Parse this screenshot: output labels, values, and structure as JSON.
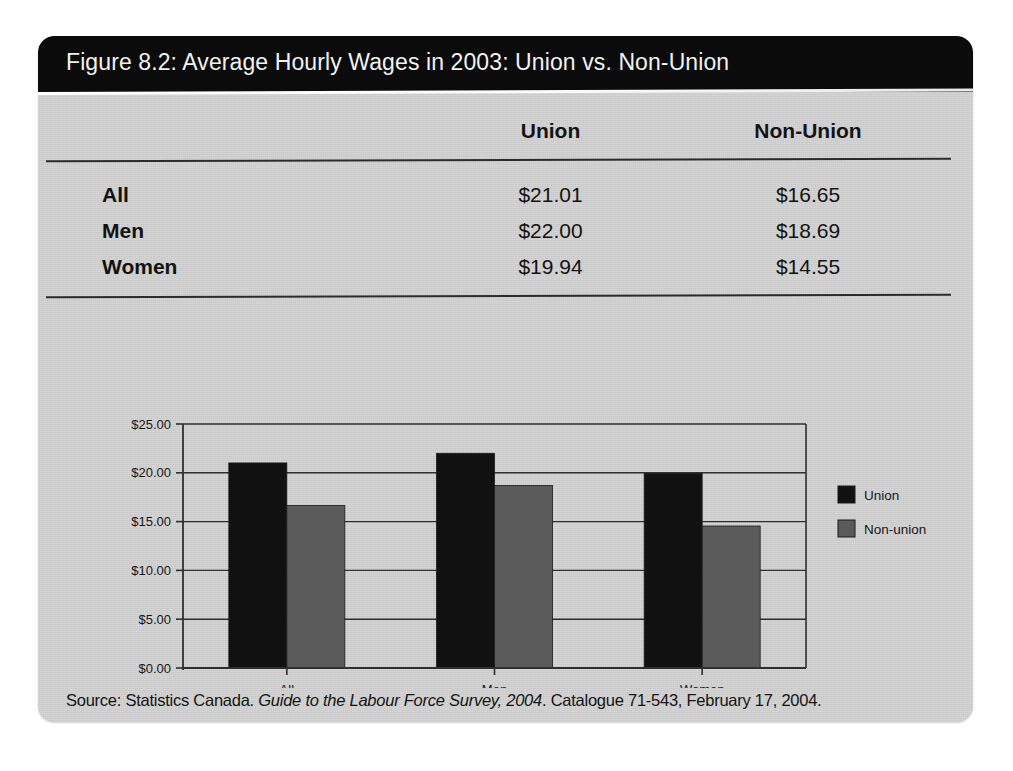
{
  "figure": {
    "title": "Figure 8.2: Average Hourly Wages in 2003: Union vs. Non-Union",
    "source_prefix": "Source: Statistics Canada. ",
    "source_italic": "Guide to the Labour Force Survey, 2004",
    "source_suffix": ". Catalogue 71-543, February 17, 2004."
  },
  "table": {
    "columns": [
      "",
      "Union",
      "Non-Union"
    ],
    "rows": [
      {
        "label": "All",
        "union": "$21.01",
        "non_union": "$16.65"
      },
      {
        "label": "Men",
        "union": "$22.00",
        "non_union": "$18.69"
      },
      {
        "label": "Women",
        "union": "$19.94",
        "non_union": "$14.55"
      }
    ]
  },
  "chart_data": {
    "type": "bar",
    "title": "",
    "xlabel": "",
    "ylabel": "",
    "categories": [
      "All",
      "Men",
      "Women"
    ],
    "series": [
      {
        "name": "Union",
        "color": "#111111",
        "values": [
          21.01,
          22.0,
          19.94
        ]
      },
      {
        "name": "Non-union",
        "color": "#5a5a5a",
        "values": [
          16.65,
          18.69,
          14.55
        ]
      }
    ],
    "ylim": [
      0,
      25
    ],
    "ytick_values": [
      0,
      5,
      10,
      15,
      20,
      25
    ],
    "ytick_labels": [
      "$0.00",
      "$5.00",
      "$10.00",
      "$15.00",
      "$20.00",
      "$25.00"
    ],
    "grid": true,
    "legend_position": "right"
  },
  "colors": {
    "page_background": "#cdcdcd",
    "title_bar": "#0b0b0b",
    "union_bar": "#111111",
    "non_union_bar": "#5a5a5a",
    "axis": "#2b2b2b"
  }
}
